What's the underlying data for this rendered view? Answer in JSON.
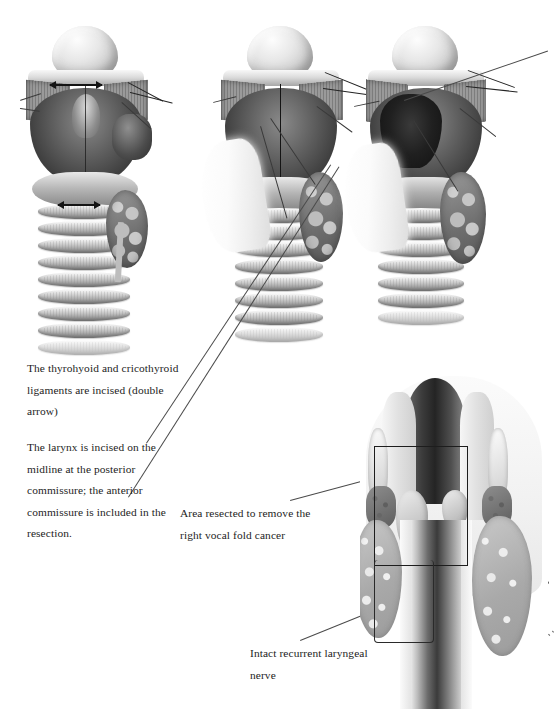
{
  "figure": {
    "domain": "medical-surgical-illustration",
    "background_color": "#ffffff",
    "text_color": "#1d1d1d",
    "line_color": "#4a4a4a"
  },
  "captions": [
    {
      "id": "thyrohyoid",
      "name": "caption-thyrohyoid-cricothyroid",
      "text": "The thyrohyoid and cricothyroid ligaments are incised (double arrow)"
    },
    {
      "id": "larynx-incised",
      "name": "caption-larynx-incised-midline",
      "text": "The larynx is incised on the midline at the posterior commissure; the anterior commissure is included in the resection."
    },
    {
      "id": "area-resected",
      "name": "caption-area-resected",
      "text": "Area resected to remove the right vocal fold cancer"
    },
    {
      "id": "intact-nerve",
      "name": "caption-intact-recurrent-laryngeal-nerve",
      "text": "Intact recurrent laryngeal nerve"
    }
  ],
  "panels": [
    {
      "id": "panel-1",
      "name": "larynx-posterior-view-ligaments",
      "label": "Posterior view of larynx with thyrohyoid and cricothyroid ligaments marked by double arrows",
      "annotations": [
        "double-arrow-thyrohyoid",
        "double-arrow-cricothyroid"
      ]
    },
    {
      "id": "panel-2",
      "name": "larynx-midline-incision",
      "label": "Larynx retracted and incised on the midline at the posterior commissure"
    },
    {
      "id": "panel-3",
      "name": "larynx-opened-exposed-lumen",
      "label": "Larynx opened exposing the endolaryngeal lumen and tumour"
    },
    {
      "id": "cross-section",
      "name": "coronal-section-larynx",
      "label": "Coronal section of the larynx showing the resection boundary around the right vocal fold"
    }
  ],
  "markers": {
    "resection_box": "Rectangular outline marking the area resected",
    "double_arrow": "↔",
    "leader_lines": 6,
    "dotted_leader_lines": 2
  },
  "structures": [
    "epiglottis",
    "hyoid bone",
    "thyroid cartilage lamina",
    "posterior commissure",
    "cricoid cartilage",
    "tracheal rings",
    "thyroid gland lobe",
    "vocal fold",
    "recurrent laryngeal nerve",
    "pharyngeal mucosa"
  ]
}
